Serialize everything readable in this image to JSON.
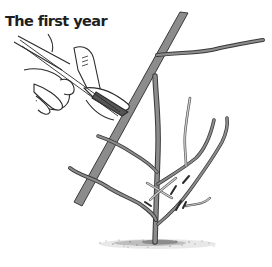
{
  "figure": {
    "title": "The first year",
    "illustration": {
      "subject": "pruning-young-tree",
      "elements": [
        "hand-with-pruning-shears",
        "large-branch",
        "young-tree",
        "cut-marks",
        "ground"
      ]
    },
    "colors": {
      "background": "#ffffff",
      "title_text": "#1e1e1e",
      "branch_fill": "#8c8c8c",
      "outline": "#3a3a3a",
      "light_branch": "#b5b5b5"
    }
  }
}
